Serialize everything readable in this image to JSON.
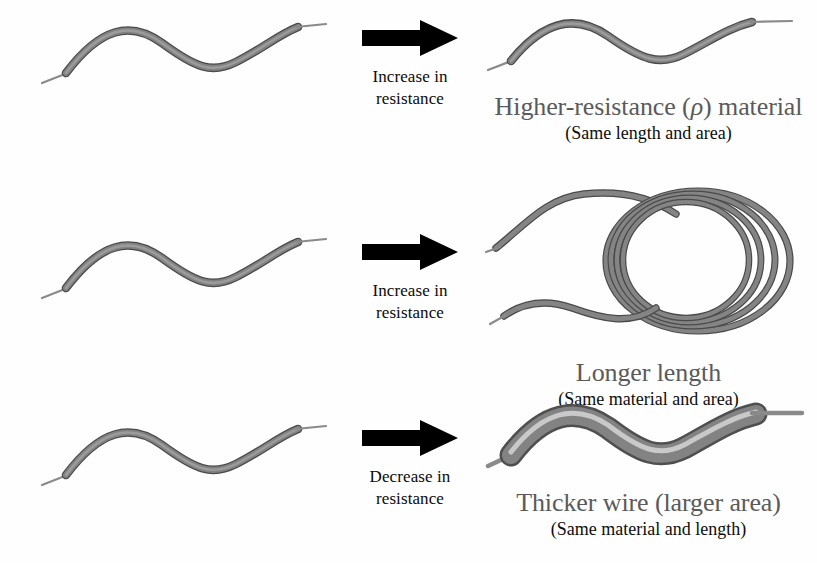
{
  "figure": {
    "background_color": "#fefefe",
    "wire_color": "#7b7b7b",
    "wire_edge_color": "#4e4e4e",
    "wire_highlight_color": "#d2d2d2",
    "arrow_color": "#000000",
    "label_color": "#5a5a5a",
    "sublabel_color": "#0d0d0d"
  },
  "rows": [
    {
      "id": "higher-resistance-material",
      "before": {
        "name": "reference-wire",
        "style": "thin-wavy"
      },
      "arrow": {
        "icon": "right-block-arrow-icon",
        "caption_line1": "Increase in",
        "caption_line2": "resistance"
      },
      "after": {
        "name": "higher-resistance-wire",
        "style": "thin-wavy",
        "label_prefix": "Higher-resistance (",
        "label_symbol": "ρ",
        "label_suffix": ") material",
        "sublabel": "(Same length and area)"
      }
    },
    {
      "id": "longer-length",
      "before": {
        "name": "reference-wire",
        "style": "thin-wavy"
      },
      "arrow": {
        "icon": "right-block-arrow-icon",
        "caption_line1": "Increase in",
        "caption_line2": "resistance"
      },
      "after": {
        "name": "coiled-long-wire",
        "style": "coiled",
        "label_prefix": "Longer length",
        "label_symbol": "",
        "label_suffix": "",
        "sublabel": "(Same material and area)"
      }
    },
    {
      "id": "thicker-wire",
      "before": {
        "name": "reference-wire",
        "style": "thin-wavy"
      },
      "arrow": {
        "icon": "right-block-arrow-icon",
        "caption_line1": "Decrease in",
        "caption_line2": "resistance"
      },
      "after": {
        "name": "thick-wavy-wire",
        "style": "thick-wavy",
        "label_prefix": "Thicker wire (larger area)",
        "label_symbol": "",
        "label_suffix": "",
        "sublabel": "(Same material and length)"
      }
    }
  ]
}
